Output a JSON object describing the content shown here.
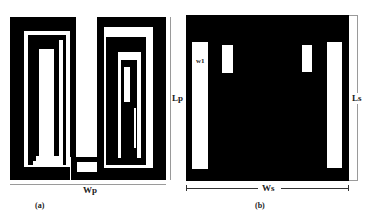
{
  "figure": {
    "panels": [
      {
        "id": "a",
        "caption": "(a)",
        "description": "Meander/spiral patch structure",
        "dimensions": {
          "width_label": "Wp",
          "length_label": "Lp"
        }
      },
      {
        "id": "b",
        "caption": "(b)",
        "description": "Ground plane with slots",
        "dimensions": {
          "width_label": "Ws",
          "length_label": "Ls"
        },
        "slot_label": "w1"
      }
    ],
    "colors": {
      "metal": "#000000",
      "background": "#ffffff",
      "dimension_line": "#9a9a9a"
    }
  }
}
